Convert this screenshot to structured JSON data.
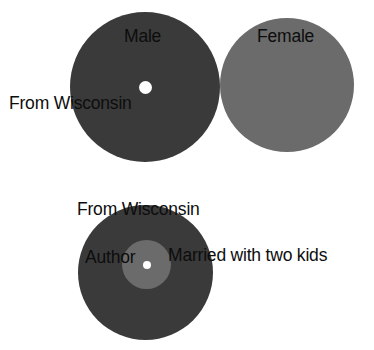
{
  "diagram": {
    "background_color": "#ffffff",
    "colors": {
      "dark_disc": "#3a3a3a",
      "mid_gray_disc": "#6b6b6b",
      "center_dot": "#ffffff",
      "label_text": "#0d0d0d"
    },
    "discs": [
      {
        "id": "male",
        "label": "Male",
        "fill": "#3a3a3a",
        "center_dot": true
      },
      {
        "id": "female",
        "label": "Female",
        "fill": "#6b6b6b",
        "center_dot": false
      },
      {
        "id": "author",
        "label": "Author",
        "fill": "#3a3a3a",
        "inner_fill": "#6b6b6b",
        "center_dot": true
      }
    ],
    "labels": {
      "male": "Male",
      "female": "Female",
      "from_wisconsin_top": "From Wisconsin",
      "from_wisconsin_bottom": "From Wisconsin",
      "author": "Author",
      "married_with_two_kids": "Married with two kids"
    }
  }
}
